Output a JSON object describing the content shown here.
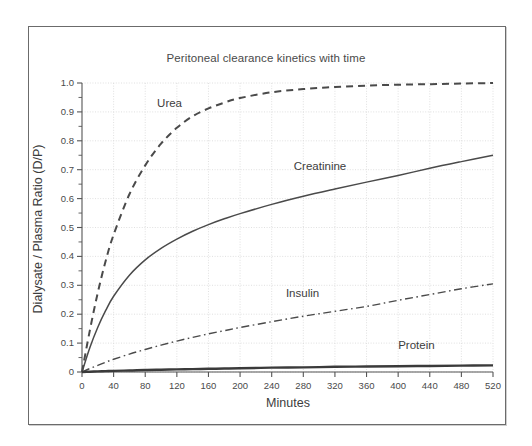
{
  "chart_data": {
    "type": "line",
    "title": "Peritoneal clearance kinetics with time",
    "xlabel": "Minutes",
    "ylabel": "Dialysate / Plasma Ratio (D/P)",
    "xlim": [
      0,
      520
    ],
    "ylim": [
      0,
      1.0
    ],
    "xticks": [
      0,
      40,
      80,
      120,
      160,
      200,
      240,
      280,
      320,
      360,
      400,
      440,
      480,
      520
    ],
    "xtick_labels": [
      "0",
      "40",
      "80",
      "120",
      "160",
      "200",
      "240",
      "280",
      "320",
      "360",
      "400",
      "440",
      "480",
      "520"
    ],
    "yticks": [
      0,
      0.1,
      0.2,
      0.3,
      0.4,
      0.5,
      0.6,
      0.7,
      0.8,
      0.9,
      1.0
    ],
    "ytick_labels": [
      "0",
      "0.1",
      "0.2",
      "0.3",
      "0.4",
      "0.5",
      "0.6",
      "0.7",
      "0.8",
      "0.9",
      "1.0"
    ],
    "y_minor_step": 0.05,
    "grid": true,
    "grid_style": "dotted",
    "grid_color": "#d8d8d8",
    "legend_position": "inline-annotations",
    "x": [
      0,
      10,
      20,
      30,
      40,
      60,
      80,
      100,
      120,
      140,
      160,
      180,
      200,
      240,
      280,
      320,
      360,
      400,
      440,
      480,
      520
    ],
    "series": [
      {
        "name": "Urea",
        "color": "#4a4a4a",
        "line_style": "dashed",
        "label_x": 95,
        "label_y": 0.925,
        "values": [
          0.0,
          0.145,
          0.275,
          0.385,
          0.475,
          0.615,
          0.715,
          0.79,
          0.845,
          0.885,
          0.912,
          0.932,
          0.948,
          0.968,
          0.979,
          0.986,
          0.991,
          0.994,
          0.996,
          0.998,
          1.0
        ]
      },
      {
        "name": "Creatinine",
        "color": "#4a4a4a",
        "line_style": "solid",
        "label_x": 268,
        "label_y": 0.705,
        "values": [
          0.0,
          0.085,
          0.155,
          0.213,
          0.262,
          0.335,
          0.388,
          0.428,
          0.46,
          0.487,
          0.51,
          0.53,
          0.548,
          0.58,
          0.608,
          0.633,
          0.657,
          0.68,
          0.705,
          0.728,
          0.75
        ]
      },
      {
        "name": "Insulin",
        "color": "#4a4a4a",
        "line_style": "dashdot",
        "label_x": 258,
        "label_y": 0.268,
        "values": [
          0.0,
          0.012,
          0.023,
          0.034,
          0.044,
          0.062,
          0.078,
          0.093,
          0.107,
          0.12,
          0.132,
          0.143,
          0.154,
          0.174,
          0.193,
          0.21,
          0.227,
          0.248,
          0.268,
          0.288,
          0.305
        ]
      },
      {
        "name": "Protein",
        "color": "#3a3a3a",
        "line_style": "solid-thick",
        "label_x": 400,
        "label_y": 0.085,
        "values": [
          0.0,
          0.001,
          0.002,
          0.003,
          0.004,
          0.005,
          0.007,
          0.008,
          0.009,
          0.01,
          0.011,
          0.012,
          0.013,
          0.015,
          0.016,
          0.018,
          0.019,
          0.02,
          0.021,
          0.022,
          0.023
        ]
      }
    ]
  }
}
